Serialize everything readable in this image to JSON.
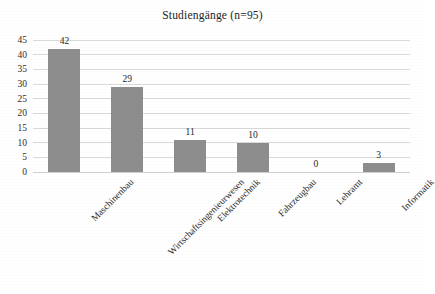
{
  "chart_data": {
    "type": "bar",
    "title": "Studiengänge (n=95)",
    "xlabel": "",
    "ylabel": "",
    "categories": [
      "Maschinenbau",
      "Wirtschaftsingenieurwesen",
      "Elektrotechnik",
      "Fahrzeugbau",
      "Lehramt",
      "Informatik"
    ],
    "values": [
      42,
      29,
      11,
      10,
      0,
      3
    ],
    "value_labels": [
      "42",
      "29",
      "11",
      "10",
      "0",
      "3"
    ],
    "ylim": [
      0,
      45
    ],
    "y_ticks": [
      0,
      5,
      10,
      15,
      20,
      25,
      30,
      35,
      40,
      45
    ],
    "y_tick_labels": [
      "0",
      "5",
      "10",
      "15",
      "20",
      "25",
      "30",
      "35",
      "40",
      "45"
    ],
    "grid": true,
    "grid_axis": "y",
    "legend": false,
    "legend_position": "none",
    "bar_color": "#8d8d8d",
    "grid_color": "#d9d9d9",
    "background_color": "#ffffff",
    "text_color": "#2b2b2b",
    "category_label_rotation": -45,
    "total_n": 95
  }
}
